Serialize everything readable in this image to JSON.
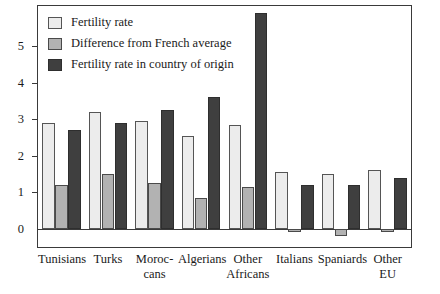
{
  "chart_data": {
    "type": "bar",
    "title": "",
    "subtitle": "",
    "xlabel": "",
    "ylabel": "",
    "ylim": [
      -0.5,
      6.1
    ],
    "yticks": [
      0,
      1,
      2,
      3,
      4,
      5
    ],
    "ytick_labels": [
      "0",
      "1",
      "2",
      "3",
      "4",
      "5"
    ],
    "grid": false,
    "legend_position": "top-left",
    "categories": [
      "Tunisians",
      "Moroc-cans",
      "Turks",
      "Algerians",
      "Other Africans",
      "Italians",
      "Spaniards",
      "Other EU"
    ],
    "category_lines": [
      [
        "Tunisians",
        ""
      ],
      [
        "Turks",
        ""
      ],
      [
        "Moroc-",
        "cans"
      ],
      [
        "Algerians",
        ""
      ],
      [
        "Other",
        "Africans"
      ],
      [
        "Italians",
        ""
      ],
      [
        "Spaniards",
        ""
      ],
      [
        "Other",
        "EU"
      ]
    ],
    "category_order": [
      "Tunisians",
      "Turks",
      "Moroc-cans",
      "Algerians",
      "Other Africans",
      "Italians",
      "Spaniards",
      "Other EU"
    ],
    "series": [
      {
        "name": "Fertility rate",
        "color": "#ececec",
        "values": [
          2.9,
          3.2,
          2.95,
          2.55,
          2.85,
          1.55,
          1.5,
          1.62
        ]
      },
      {
        "name": "Difference from French average",
        "color": "#b2b2b2",
        "values": [
          1.2,
          1.5,
          1.25,
          0.85,
          1.15,
          -0.08,
          -0.2,
          -0.1
        ]
      },
      {
        "name": "Fertility rate in country of origin",
        "color": "#3f3f3f",
        "values": [
          2.7,
          2.9,
          3.25,
          3.6,
          5.9,
          1.2,
          1.2,
          1.4
        ]
      }
    ]
  },
  "legend": {
    "items": [
      {
        "label": "Fertility rate",
        "swatch": "light-swatch"
      },
      {
        "label": "Difference from French average",
        "swatch": "medium-swatch"
      },
      {
        "label": "Fertility rate in country of origin",
        "swatch": "dark-swatch"
      }
    ]
  },
  "colors": {
    "series_light": "#ececec",
    "series_medium": "#b2b2b2",
    "series_dark": "#3f3f3f",
    "axis": "#3a3a3a",
    "background": "#ffffff",
    "text": "#1a1a1a"
  }
}
